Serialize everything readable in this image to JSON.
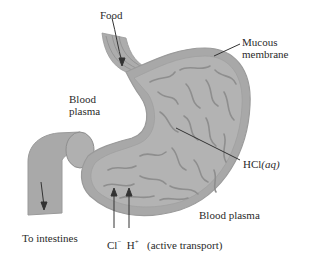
{
  "diagram": {
    "colors": {
      "stomach_fill": "#a8a8a8",
      "stomach_inner": "#b4b4b4",
      "fold_lines": "#8e8e8e",
      "outline": "#9a9a9a",
      "arrow": "#333333",
      "background": "#ffffff"
    },
    "labels": {
      "food": "Food",
      "mucous_line1": "Mucous",
      "mucous_line2": "membrane",
      "blood_plasma_left_line1": "Blood",
      "blood_plasma_left_line2": "plasma",
      "hcl": "HCl",
      "hcl_state": "(aq)",
      "blood_plasma_right": "Blood plasma",
      "to_intestines": "To intestines",
      "cl_ion": "Cl",
      "cl_charge": "−",
      "h_ion": "H",
      "h_charge": "+",
      "active_transport": "(active transport)"
    }
  }
}
